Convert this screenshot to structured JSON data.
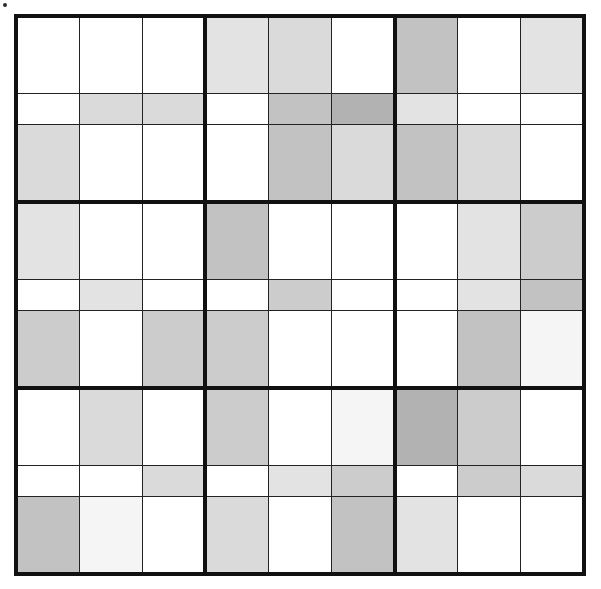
{
  "figure": {
    "kind": "grid-heatmap",
    "title": "",
    "rows": 9,
    "columns": 9,
    "block_size": 3,
    "background_color": "#ffffff",
    "line_color": "#222222",
    "block_line_color": "#111111",
    "artifact": {
      "name": "speck",
      "x": 3,
      "y": 3
    }
  },
  "chart_data": {
    "type": "heatmap",
    "title": "",
    "xlabel": "",
    "ylabel": "",
    "grid": true,
    "legend": "none",
    "categories": [
      "C1",
      "C2",
      "C3",
      "C4",
      "C5",
      "C6",
      "C7",
      "C8",
      "C9"
    ],
    "row_labels": [
      "R1",
      "R2",
      "R3",
      "R4",
      "R5",
      "R6",
      "R7",
      "R8",
      "R9"
    ],
    "value_scale": "0 = white (unfilled), 1 = lightest fill, 6 = darkest fill",
    "values": [
      [
        0,
        0,
        0,
        2,
        3,
        0,
        5,
        0,
        2
      ],
      [
        0,
        3,
        3,
        0,
        5,
        6,
        2,
        0,
        0
      ],
      [
        3,
        0,
        0,
        0,
        5,
        3,
        5,
        3,
        0
      ],
      [
        2,
        0,
        0,
        5,
        0,
        0,
        0,
        2,
        4
      ],
      [
        0,
        2,
        0,
        0,
        4,
        0,
        0,
        2,
        5
      ],
      [
        4,
        0,
        4,
        4,
        0,
        0,
        0,
        5,
        1
      ],
      [
        0,
        3,
        0,
        4,
        0,
        1,
        6,
        4,
        0
      ],
      [
        0,
        0,
        3,
        0,
        2,
        4,
        0,
        4,
        3
      ],
      [
        5,
        1,
        0,
        3,
        0,
        5,
        2,
        0,
        0
      ]
    ],
    "palette": {
      "0": "#ffffff",
      "1": "#f5f5f5",
      "2": "#e3e3e3",
      "3": "#dadada",
      "4": "#cccccc",
      "5": "#c2c2c2",
      "6": "#b2b2b2"
    }
  }
}
